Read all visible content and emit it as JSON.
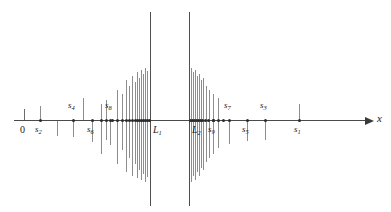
{
  "figure": {
    "background_color": "#ffffff",
    "axis_color": "#4a4a4a",
    "stem_color": "#8d8d8d",
    "dot_color": "#2b2b2b",
    "limit_line_color": "#4f4f4f",
    "axis": {
      "label": "x",
      "origin_label": "0",
      "arrow_name": "axis-arrow-right",
      "y": 120,
      "x_start": 14,
      "x_end": 365
    },
    "limits": [
      {
        "name": "L1",
        "label_html": "L<sub>1</sub>",
        "x": 150,
        "top": 12,
        "bottom": 206,
        "side": "below-right"
      },
      {
        "name": "L2",
        "label_html": "L<sub>2</sub>",
        "x": 189,
        "top": 12,
        "bottom": 206,
        "side": "below-right"
      }
    ],
    "origin_tick": {
      "x": 24,
      "label": "0",
      "height": 11
    },
    "labeled_points": [
      {
        "name": "s2",
        "label_html": "s<sub>2</sub>",
        "x": 40,
        "side": "below",
        "stem_dir": "up",
        "stem_len": 14
      },
      {
        "name": "s4",
        "label_html": "s<sub>4</sub>",
        "x": 73,
        "side": "above",
        "stem_dir": "down",
        "stem_len": 17
      },
      {
        "name": "s6",
        "label_html": "s<sub>6</sub>",
        "x": 92,
        "side": "below",
        "stem_dir": "up",
        "stem_len": 22
      },
      {
        "name": "s8",
        "label_html": "s<sub>8</sub>",
        "x": 110,
        "side": "above",
        "stem_dir": "down",
        "stem_len": 25
      },
      {
        "name": "s9",
        "label_html": "s<sub>9</sub>",
        "x": 213,
        "side": "below",
        "stem_dir": "up",
        "stem_len": 26
      },
      {
        "name": "s7",
        "label_html": "s<sub>7</sub>",
        "x": 229,
        "side": "above",
        "stem_dir": "down",
        "stem_len": 24
      },
      {
        "name": "s5",
        "label_html": "s<sub>5</sub>",
        "x": 247,
        "side": "below",
        "stem_dir": "up",
        "stem_len": 21
      },
      {
        "name": "s3",
        "label_html": "s<sub>3</sub>",
        "x": 265,
        "side": "above",
        "stem_dir": "down",
        "stem_len": 20
      },
      {
        "name": "s1",
        "label_html": "s<sub>1</sub>",
        "x": 299,
        "side": "below",
        "stem_dir": "up",
        "stem_len": 16
      }
    ],
    "cluster_left": {
      "description": "terms accumulating from the left toward L1",
      "stems": [
        {
          "x": 101,
          "up": 16,
          "down": 34
        },
        {
          "x": 106,
          "up": 20,
          "down": 20
        },
        {
          "x": 117,
          "up": 30,
          "down": 44
        },
        {
          "x": 122,
          "up": 26,
          "down": 30
        },
        {
          "x": 126,
          "up": 40,
          "down": 52
        },
        {
          "x": 129,
          "up": 34,
          "down": 38
        },
        {
          "x": 132,
          "up": 44,
          "down": 56
        },
        {
          "x": 135,
          "up": 38,
          "down": 44
        },
        {
          "x": 137,
          "up": 48,
          "down": 58
        },
        {
          "x": 139,
          "up": 42,
          "down": 50
        },
        {
          "x": 141,
          "up": 50,
          "down": 60
        },
        {
          "x": 143,
          "up": 46,
          "down": 54
        },
        {
          "x": 145,
          "up": 52,
          "down": 62
        },
        {
          "x": 147,
          "up": 49,
          "down": 57
        }
      ],
      "dots": [
        101,
        106,
        112,
        117,
        122,
        126,
        129,
        132,
        135,
        137,
        139,
        141,
        143,
        145,
        147,
        149
      ]
    },
    "cluster_right": {
      "description": "terms accumulating from the right toward L2",
      "stems": [
        {
          "x": 191,
          "up": 52,
          "down": 62
        },
        {
          "x": 193,
          "up": 48,
          "down": 56
        },
        {
          "x": 195,
          "up": 50,
          "down": 60
        },
        {
          "x": 197,
          "up": 44,
          "down": 52
        },
        {
          "x": 199,
          "up": 46,
          "down": 56
        },
        {
          "x": 201,
          "up": 40,
          "down": 48
        },
        {
          "x": 203,
          "up": 42,
          "down": 50
        },
        {
          "x": 206,
          "up": 34,
          "down": 42
        },
        {
          "x": 209,
          "up": 30,
          "down": 38
        },
        {
          "x": 213,
          "up": 26,
          "down": 34
        },
        {
          "x": 218,
          "up": 22,
          "down": 28
        }
      ],
      "dots": [
        190,
        192,
        194,
        196,
        198,
        200,
        202,
        205,
        208,
        213,
        218,
        223
      ]
    },
    "sparse_left_stems": [
      {
        "x": 40,
        "up": 14,
        "down": 0
      },
      {
        "x": 57,
        "up": 0,
        "down": 16
      },
      {
        "x": 73,
        "up": 0,
        "down": 17
      },
      {
        "x": 83,
        "up": 22,
        "down": 0
      },
      {
        "x": 92,
        "up": 0,
        "down": 22
      },
      {
        "x": 110,
        "up": 0,
        "down": 25
      }
    ],
    "sparse_right_stems": [
      {
        "x": 229,
        "up": 0,
        "down": 24
      },
      {
        "x": 247,
        "up": 0,
        "down": 21
      },
      {
        "x": 265,
        "up": 0,
        "down": 20
      },
      {
        "x": 299,
        "up": 16,
        "down": 0
      }
    ]
  }
}
